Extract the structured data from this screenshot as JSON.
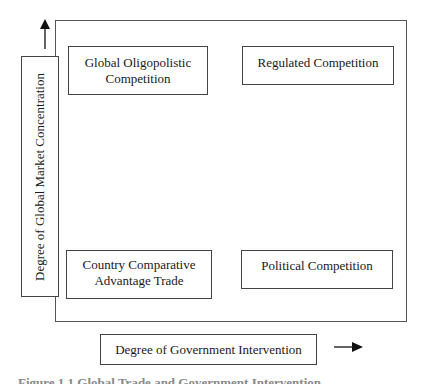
{
  "diagram": {
    "type": "2x2 matrix",
    "y_axis": {
      "label": "Degree of Global Market Concentration",
      "direction": "up"
    },
    "x_axis": {
      "label": "Degree of Government Intervention",
      "direction": "right"
    },
    "quadrants": {
      "top_left": "Global Oligopolistic Competition",
      "top_right": "Regulated Competition",
      "bottom_left": "Country Comparative Advantage Trade",
      "bottom_right": "Political Competition"
    },
    "caption": "Figure 1.1 Global Trade and Government Intervention"
  },
  "colors": {
    "line": "#444444",
    "text": "#1a1a1a",
    "background": "#ffffff"
  }
}
